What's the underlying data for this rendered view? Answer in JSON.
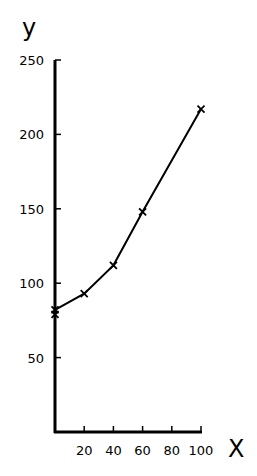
{
  "chart_data": {
    "type": "line",
    "title": "",
    "xlabel": "X",
    "ylabel": "y",
    "xlim": [
      0,
      100
    ],
    "ylim": [
      0,
      250
    ],
    "x_ticks": [
      20,
      40,
      60,
      80,
      100
    ],
    "y_ticks": [
      50,
      100,
      150,
      200,
      250
    ],
    "grid": false,
    "legend": null,
    "series": [
      {
        "name": "y",
        "marker": "x",
        "x": [
          0,
          20,
          40,
          60,
          100
        ],
        "values": [
          82,
          93,
          112,
          148,
          217
        ]
      }
    ],
    "extra_markers": [
      {
        "x": 0,
        "y": 79
      }
    ]
  }
}
